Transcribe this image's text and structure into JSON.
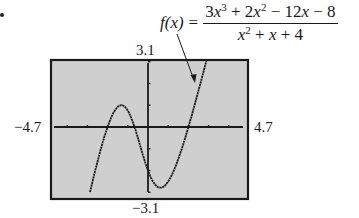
{
  "formula": {
    "lhs": "f(x)",
    "equals": "=",
    "numerator_text": "3x^3 + 2x^2 - 12x - 8",
    "denominator_text": "x^2 + x + 4"
  },
  "window": {
    "ymax_label": "3.1",
    "ymin_label": "−3.1",
    "xmin_label": "−4.7",
    "xmax_label": "4.7"
  },
  "colors": {
    "screen_background": "#cfcfcf",
    "frame": "#1a1a1a",
    "curve": "#1a1a1a",
    "axis": "#1a1a1a"
  },
  "chart_data": {
    "type": "line",
    "xlabel": "",
    "ylabel": "",
    "xlim": [
      -4.7,
      4.7
    ],
    "ylim": [
      -3.1,
      3.1
    ],
    "grid": false,
    "legend": "none",
    "x_ticks": [
      -4,
      -3,
      -2,
      -1,
      1,
      2,
      3,
      4
    ],
    "y_ticks": [
      -3,
      -2,
      -1,
      1,
      2,
      3
    ],
    "annotations": [
      {
        "text": "f(x) = (3x^3 + 2x^2 - 12x - 8)/(x^2 + x + 4)",
        "arrow_to": [
          3.3,
          2.1
        ]
      }
    ],
    "series": [
      {
        "name": "f(x)",
        "x": [
          -3.0,
          -2.8,
          -2.6,
          -2.4,
          -2.2,
          -2.0,
          -1.8,
          -1.6,
          -1.4,
          -1.2,
          -1.0,
          -0.8,
          -0.667,
          -0.4,
          -0.2,
          0.0,
          0.2,
          0.4,
          0.6,
          0.8,
          1.0,
          1.2,
          1.4,
          1.6,
          1.8,
          2.0,
          2.2,
          2.4,
          2.6,
          2.8,
          3.0,
          3.2
        ],
        "y": [
          -3.5,
          -2.54,
          -1.67,
          -0.89,
          -0.21,
          0.0,
          0.74,
          0.93,
          0.98,
          0.88,
          0.75,
          0.3,
          0.0,
          -0.89,
          -1.43,
          -2.0,
          -2.41,
          -2.7,
          -2.79,
          -2.72,
          -2.5,
          -2.14,
          -1.66,
          -1.08,
          -0.43,
          0.0,
          0.55,
          1.22,
          1.93,
          2.68,
          3.44,
          4.22
        ]
      }
    ]
  }
}
